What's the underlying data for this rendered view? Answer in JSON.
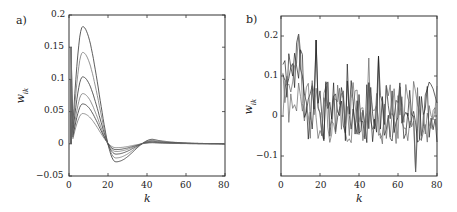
{
  "chart_data": [
    {
      "panel": "a)",
      "type": "line",
      "title": "",
      "xlabel": "k",
      "ylabel": "w_{ik}",
      "xlim": [
        0,
        80
      ],
      "ylim": [
        -0.05,
        0.2
      ],
      "xticks": [
        "0",
        "20",
        "40",
        "60",
        "80"
      ],
      "yticks": [
        "0.2",
        "0.15",
        "0.1",
        "0.05",
        "0",
        "−0.05"
      ],
      "grid": false,
      "legend": null,
      "series_description": "Six smooth damped-oscillation curves; each starts near 0.15/0.1/0.05 at k=1, dips at k≈2, peaks at k≈7, crosses zero near k≈19, minimum near k≈24, small overshoot near k≈43, then decays to 0.",
      "series": [
        {
          "name": "curve-1",
          "peak": 0.182,
          "min": -0.028,
          "start": 0.15
        },
        {
          "name": "curve-2",
          "peak": 0.142,
          "min": -0.022,
          "start": 0.15
        },
        {
          "name": "curve-3",
          "peak": 0.104,
          "min": -0.016,
          "start": 0.1
        },
        {
          "name": "curve-4",
          "peak": 0.078,
          "min": -0.012,
          "start": 0.1
        },
        {
          "name": "curve-5",
          "peak": 0.062,
          "min": -0.009,
          "start": 0.05
        },
        {
          "name": "curve-6",
          "peak": 0.047,
          "min": -0.006,
          "start": 0.05
        }
      ]
    },
    {
      "panel": "b)",
      "type": "line",
      "title": "",
      "xlabel": "k",
      "ylabel": "w_{ik}",
      "xlim": [
        0,
        80
      ],
      "ylim": [
        -0.15,
        0.25
      ],
      "xticks": [
        "0",
        "20",
        "40",
        "60",
        "80"
      ],
      "yticks": [
        "0.2",
        "0.1",
        "0",
        "−0.1"
      ],
      "grid": false,
      "legend": null,
      "series_description": "Several noisy overlapping series; elevated values (~0.05–0.2) for k<12, then noisy fluctuation around 0 in roughly [-0.1, 0.15], with spikes ~0.19 at k≈18, ~0.15 at k≈50 and a dip to ~-0.14 at k≈69.",
      "annotations": [
        {
          "k": 9,
          "value": 0.205,
          "note": "max early peak"
        },
        {
          "k": 18,
          "value": 0.19,
          "note": "spike"
        },
        {
          "k": 34,
          "value": 0.13,
          "note": "spike"
        },
        {
          "k": 45,
          "value": 0.145,
          "note": "spike"
        },
        {
          "k": 50,
          "value": 0.15,
          "note": "spike"
        },
        {
          "k": 69,
          "value": -0.14,
          "note": "min dip"
        }
      ]
    }
  ],
  "panels": {
    "a": {
      "label": "a)",
      "ylabel": "w",
      "ylabel_sub": "ik",
      "xlabel": "k",
      "yticks": [
        "0.2",
        "0.15",
        "0.1",
        "0.05",
        "0",
        "−0.05"
      ],
      "xticks": [
        "0",
        "20",
        "40",
        "60",
        "80"
      ]
    },
    "b": {
      "label": "b)",
      "ylabel": "w",
      "ylabel_sub": "ik",
      "xlabel": "k",
      "yticks": [
        "0.2",
        "0.1",
        "0",
        "−0.1"
      ],
      "xticks": [
        "0",
        "20",
        "40",
        "60",
        "80"
      ]
    }
  }
}
